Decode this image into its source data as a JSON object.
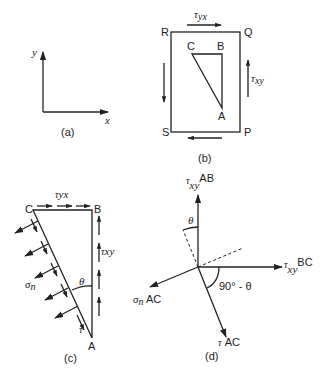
{
  "panel_a": {
    "caption": "(a)",
    "axis_x": "x",
    "axis_y": "y"
  },
  "panel_b": {
    "caption": "(b)",
    "corners": {
      "R": "R",
      "Q": "Q",
      "S": "S",
      "P": "P"
    },
    "triangle": {
      "A": "A",
      "B": "B",
      "C": "C"
    },
    "tau_yx": {
      "sym": "τ",
      "sub": "yx"
    },
    "tau_xy": {
      "sym": "τ",
      "sub": "xy"
    }
  },
  "panel_c": {
    "caption": "(c)",
    "C": "C",
    "B": "B",
    "A": "A",
    "tau_yx": {
      "sym": "τ",
      "sub": "yx"
    },
    "tau_xy": {
      "sym": "τ",
      "sub": "xy"
    },
    "sigma": {
      "sym": "σ",
      "sub": "n"
    },
    "tau": "τ",
    "theta": "θ"
  },
  "panel_d": {
    "caption": "(d)",
    "tau_xy_ab": {
      "sym": "τ",
      "sub": "xy",
      "sup": "AB"
    },
    "tau_xy_bc": {
      "sym": "τ",
      "sub": "xy",
      "sup": "BC"
    },
    "sigma_ac": {
      "sym": "σ",
      "sub": "n",
      "suffix": " AC"
    },
    "tau_ac": {
      "sym": "τ",
      "suffix": " AC"
    },
    "theta": "θ",
    "angle": "90° - θ"
  }
}
